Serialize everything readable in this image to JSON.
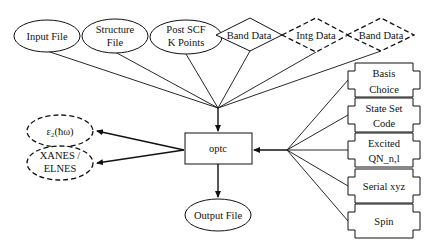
{
  "diagram": {
    "center_node": {
      "label": "optc"
    },
    "inputs_top": [
      {
        "label": "Input File",
        "shape": "ellipse",
        "style": "solid"
      },
      {
        "label_lines": [
          "Structure",
          "File"
        ],
        "shape": "ellipse",
        "style": "solid"
      },
      {
        "label_lines": [
          "Post SCF",
          "K Points"
        ],
        "shape": "ellipse",
        "style": "solid"
      },
      {
        "label": "Band Data",
        "shape": "diamond",
        "style": "solid"
      },
      {
        "label": "Intg Data",
        "shape": "diamond",
        "style": "dashed"
      },
      {
        "label": "Band Data",
        "shape": "diamond",
        "style": "dashed"
      }
    ],
    "inputs_right": [
      {
        "label_lines": [
          "Basis",
          "Choice"
        ],
        "shape": "notched-box"
      },
      {
        "label_lines": [
          "State Set",
          "Code"
        ],
        "shape": "notched-box"
      },
      {
        "label_lines": [
          "Excited",
          "QN_n,l"
        ],
        "shape": "notched-box"
      },
      {
        "label": "Serial xyz",
        "shape": "notched-box"
      },
      {
        "label": "Spin",
        "shape": "notched-box"
      }
    ],
    "outputs_left": [
      {
        "label": "ε₂(ħω)",
        "shape": "ellipse",
        "style": "dashed"
      },
      {
        "label_lines": [
          "XANES /",
          "ELNES"
        ],
        "shape": "ellipse",
        "style": "dashed"
      }
    ],
    "output_bottom": {
      "label": "Output File",
      "shape": "ellipse",
      "style": "solid"
    }
  }
}
